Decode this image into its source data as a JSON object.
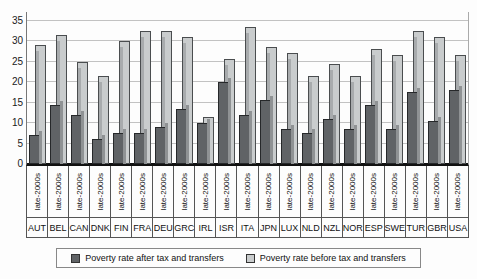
{
  "chart_data": {
    "type": "bar",
    "title": "",
    "xlabel": "",
    "ylabel": "",
    "ylim": [
      0,
      35
    ],
    "yticks": [
      0,
      5,
      10,
      15,
      20,
      25,
      30,
      35
    ],
    "grid": true,
    "legend_position": "bottom",
    "period_label": "late-2000s",
    "categories": [
      "AUT",
      "BEL",
      "CAN",
      "DNK",
      "FIN",
      "FRA",
      "DEU",
      "GRC",
      "IRL",
      "ISR",
      "ITA",
      "JPN",
      "LUX",
      "NLD",
      "NZL",
      "NOR",
      "ESP",
      "SWE",
      "TUR",
      "GBR",
      "USA"
    ],
    "series": [
      {
        "name": "Poverty rate after tax and transfers",
        "color": "#606366",
        "values": [
          7,
          14.5,
          12,
          6,
          7.5,
          7.5,
          9,
          13.5,
          10,
          20,
          12,
          15.5,
          8.5,
          7.5,
          11,
          8.5,
          14.5,
          8.5,
          17.5,
          10.5,
          18
        ]
      },
      {
        "name": "Poverty rate before tax and transfers",
        "color": "#c9cccd",
        "values": [
          29,
          31.5,
          25,
          21.5,
          30,
          32.5,
          32.5,
          31,
          11.5,
          25.5,
          33.5,
          28.5,
          27,
          21.5,
          24.5,
          21.5,
          28,
          26.5,
          32.5,
          31,
          26.5
        ]
      }
    ]
  }
}
